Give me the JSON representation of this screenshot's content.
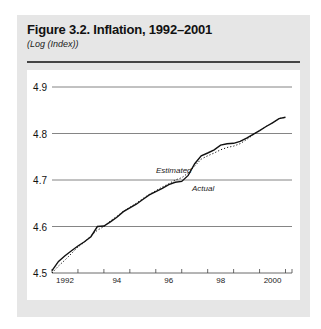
{
  "figure": {
    "title": "Figure 3.2. Inflation, 1992–2001",
    "subtitle": "(Log (Index))"
  },
  "chart_data": {
    "type": "line",
    "title": "Figure 3.2. Inflation, 1992–2001",
    "subtitle": "(Log (Index))",
    "xlabel": "",
    "ylabel": "Log (Index)",
    "ylim": [
      4.5,
      4.9
    ],
    "yticks": [
      "4.5",
      "4.6",
      "4.7",
      "4.8",
      "4.9"
    ],
    "xticks": [
      "1992",
      "94",
      "96",
      "98",
      "2000"
    ],
    "xlim": [
      1992.0,
      2001.25
    ],
    "grid": true,
    "legend": "inline annotations",
    "annotations": [
      "Estimated",
      "Actual"
    ],
    "x": [
      1992.0,
      1992.25,
      1992.5,
      1992.75,
      1993.0,
      1993.25,
      1993.5,
      1993.75,
      1994.0,
      1994.25,
      1994.5,
      1994.75,
      1995.0,
      1995.25,
      1995.5,
      1995.75,
      1996.0,
      1996.25,
      1996.5,
      1996.75,
      1997.0,
      1997.25,
      1997.5,
      1997.75,
      1998.0,
      1998.25,
      1998.5,
      1998.75,
      1999.0,
      1999.25,
      1999.5,
      1999.75,
      2000.0,
      2000.25,
      2000.5,
      2000.75,
      2001.0
    ],
    "series": [
      {
        "name": "Actual",
        "style": "solid",
        "values": [
          4.505,
          4.525,
          4.537,
          4.548,
          4.558,
          4.567,
          4.578,
          4.6,
          4.601,
          4.61,
          4.62,
          4.632,
          4.64,
          4.648,
          4.658,
          4.668,
          4.675,
          4.682,
          4.69,
          4.695,
          4.697,
          4.71,
          4.735,
          4.752,
          4.758,
          4.765,
          4.775,
          4.778,
          4.779,
          4.783,
          4.79,
          4.798,
          4.806,
          4.815,
          4.823,
          4.832,
          4.835
        ]
      },
      {
        "name": "Estimated",
        "style": "dotted",
        "values": [
          4.5,
          4.515,
          4.528,
          4.542,
          4.556,
          4.566,
          4.58,
          4.592,
          4.6,
          4.612,
          4.622,
          4.633,
          4.641,
          4.65,
          4.66,
          4.669,
          4.677,
          4.685,
          4.692,
          4.7,
          4.705,
          4.715,
          4.73,
          4.745,
          4.752,
          4.758,
          4.765,
          4.77,
          4.773,
          4.778,
          4.787,
          4.797,
          4.806,
          4.815,
          4.823,
          4.832,
          4.835
        ]
      }
    ]
  }
}
